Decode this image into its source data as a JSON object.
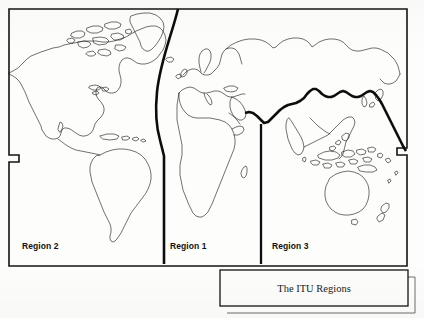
{
  "figure": {
    "caption": "The ITU Regions",
    "kind": "world-map-line-drawing",
    "ink_color": "#111111",
    "paper_color": "#fdfdfb"
  },
  "regions": [
    {
      "id": "region-2",
      "label": "Region 2",
      "label_x": 22,
      "label_y": 245
    },
    {
      "id": "region-1",
      "label": "Region 1",
      "label_x": 170,
      "label_y": 245
    },
    {
      "id": "region-3",
      "label": "Region 3",
      "label_x": 272,
      "label_y": 245
    }
  ],
  "boundaries": {
    "region2_region1_label": "Region 2 / Region 1 boundary (Atlantic, curved)",
    "region1_region3_label": "Region 1 / Region 3 boundary (vertical at ~60E)",
    "region1_region3_north_label": "Region 1 / Region 3 boundary (southern border of Russia, heavy)"
  },
  "frame": {
    "note": "map border with stepped notch at left and right",
    "left_x": 9,
    "right_x": 407,
    "top_y": 9,
    "bottom_y": 266,
    "notch_y": 155,
    "notch_left_x": 19,
    "notch_right_x": 397
  },
  "caption_box": {
    "x": 220,
    "y": 270,
    "width": 188,
    "height": 36,
    "shadow_offset": 7
  }
}
